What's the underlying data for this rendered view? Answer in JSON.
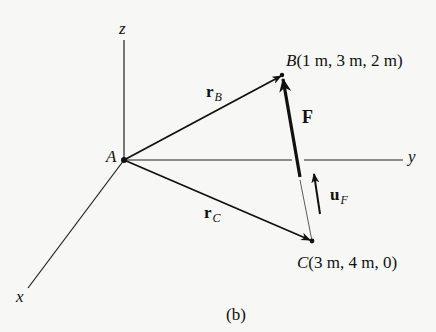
{
  "figure": {
    "caption": "(b)",
    "axes": {
      "x_label": "x",
      "y_label": "y",
      "z_label": "z"
    },
    "origin": {
      "label": "A"
    },
    "points": {
      "B": {
        "name": "B",
        "coords": "(1 m, 3 m, 2 m)"
      },
      "C": {
        "name": "C",
        "coords": "(3 m, 4 m, 0)"
      }
    },
    "vectors": {
      "rB": {
        "symbol": "r",
        "subscript": "B"
      },
      "rC": {
        "symbol": "r",
        "subscript": "C"
      },
      "F": {
        "symbol": "F"
      },
      "uF": {
        "symbol": "u",
        "subscript": "F"
      }
    },
    "colors": {
      "ink": "#111111",
      "background": "#f7f7f5"
    }
  }
}
